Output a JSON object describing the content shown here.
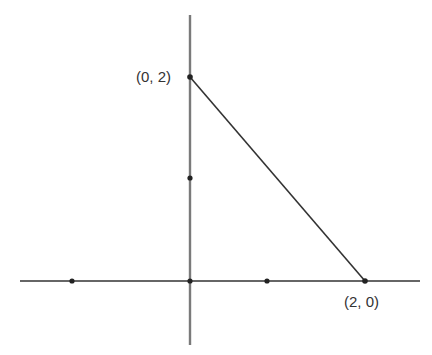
{
  "diagram": {
    "type": "coordinate-plane",
    "axes": {
      "x_axis": {
        "y": 281,
        "x1": 20,
        "x2": 420,
        "color": "#333333"
      },
      "y_axis": {
        "x": 190,
        "y1": 15,
        "y2": 345,
        "color": "#777777"
      }
    },
    "points": [
      {
        "id": "x-tick-left",
        "cx": 72,
        "cy": 281
      },
      {
        "id": "origin",
        "cx": 190,
        "cy": 281
      },
      {
        "id": "x-tick-1",
        "cx": 267,
        "cy": 281
      },
      {
        "id": "point-2-0",
        "cx": 365,
        "cy": 281
      },
      {
        "id": "y-tick-1",
        "cx": 190,
        "cy": 178
      },
      {
        "id": "point-0-2",
        "cx": 190,
        "cy": 77
      }
    ],
    "segment": {
      "from": "(0, 2)",
      "to": "(2, 0)",
      "x1": 190,
      "y1": 77,
      "x2": 365,
      "y2": 281,
      "color": "#333333"
    },
    "labels": {
      "point_0_2": "(0, 2)",
      "point_2_0": "(2, 0)"
    }
  }
}
